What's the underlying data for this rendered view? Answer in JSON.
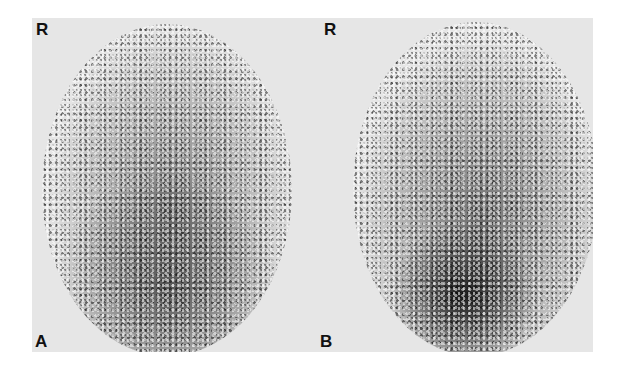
{
  "figure": {
    "panels": [
      {
        "id": "A",
        "orientation_label": "R",
        "panel_label": "A"
      },
      {
        "id": "B",
        "orientation_label": "R",
        "panel_label": "B"
      }
    ]
  },
  "colors": {
    "background": "#ffffff",
    "panel_gray": "#e6e6e6",
    "text": "#111111"
  }
}
